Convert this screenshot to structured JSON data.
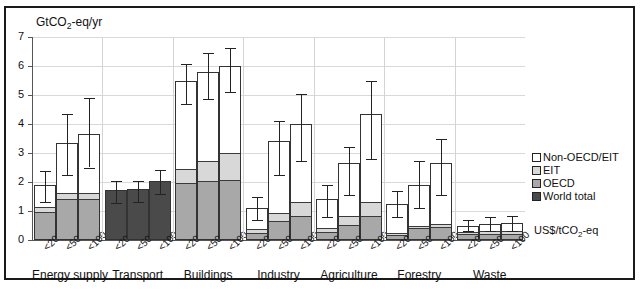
{
  "chart_data": {
    "type": "bar",
    "title": "GtCO2-eq/yr",
    "title_html": "GtCO<sub>2</sub>-eq/yr",
    "ylabel": "GtCO2-eq/yr",
    "xlabel": "US$/tCO2-eq",
    "xlabel_html": "US$/tCO<sub>2</sub>-eq",
    "ylim": [
      0,
      7
    ],
    "yticks": [
      0,
      1,
      2,
      3,
      4,
      5,
      6,
      7
    ],
    "ytick_labels": [
      "0",
      "1",
      "2",
      "3",
      "4",
      "5",
      "6",
      "7"
    ],
    "grid": true,
    "legend_position": "right",
    "stacked": true,
    "categories": [
      "Energy supply",
      "Transport",
      "Buildings",
      "Industry",
      "Agriculture",
      "Forestry",
      "Waste"
    ],
    "subcategories": [
      "<20",
      "<50",
      "<100"
    ],
    "series": [
      {
        "name": "OECD",
        "color": "#a8a8a8"
      },
      {
        "name": "EIT",
        "color": "#d8d8d8"
      },
      {
        "name": "Non-OECD/EIT",
        "color": "#ffffff"
      },
      {
        "name": "World total",
        "color": "#4a4a4a"
      }
    ],
    "groups": [
      {
        "label": "Energy supply",
        "world_total_only": false,
        "bars": [
          {
            "sub": "<20",
            "oecd": 0.92,
            "eit": 0.18,
            "non_oecd": 0.8,
            "total": 1.9,
            "err_low": 1.32,
            "err_high": 2.38
          },
          {
            "sub": "<50",
            "oecd": 1.38,
            "eit": 0.2,
            "non_oecd": 1.77,
            "total": 3.35,
            "err_low": 2.25,
            "err_high": 4.35
          },
          {
            "sub": "<100",
            "oecd": 1.38,
            "eit": 0.22,
            "non_oecd": 2.07,
            "total": 3.67,
            "err_low": 2.5,
            "err_high": 4.9
          }
        ]
      },
      {
        "label": "Transport",
        "world_total_only": true,
        "bars": [
          {
            "sub": "<20",
            "world": 1.72,
            "total": 1.72,
            "err_low": 1.28,
            "err_high": 2.03
          },
          {
            "sub": "<50",
            "world": 1.76,
            "total": 1.76,
            "err_low": 1.32,
            "err_high": 2.05
          },
          {
            "sub": "<100",
            "world": 2.03,
            "total": 2.03,
            "err_low": 1.6,
            "err_high": 2.42
          }
        ]
      },
      {
        "label": "Buildings",
        "world_total_only": false,
        "bars": [
          {
            "sub": "<20",
            "oecd": 1.92,
            "eit": 0.48,
            "non_oecd": 3.1,
            "total": 5.5,
            "err_low": 4.68,
            "err_high": 6.07
          },
          {
            "sub": "<50",
            "oecd": 2.0,
            "eit": 0.7,
            "non_oecd": 3.08,
            "total": 5.78,
            "err_low": 4.85,
            "err_high": 6.45
          },
          {
            "sub": "<100",
            "oecd": 2.03,
            "eit": 0.93,
            "non_oecd": 3.04,
            "total": 6.0,
            "err_low": 5.1,
            "err_high": 6.62
          }
        ]
      },
      {
        "label": "Industry",
        "world_total_only": false,
        "bars": [
          {
            "sub": "<20",
            "oecd": 0.22,
            "eit": 0.12,
            "non_oecd": 0.76,
            "total": 1.1,
            "err_low": 0.68,
            "err_high": 1.5
          },
          {
            "sub": "<50",
            "oecd": 0.62,
            "eit": 0.27,
            "non_oecd": 2.53,
            "total": 3.42,
            "err_low": 2.25,
            "err_high": 4.1
          },
          {
            "sub": "<100",
            "oecd": 0.8,
            "eit": 0.47,
            "non_oecd": 2.73,
            "total": 4.0,
            "err_low": 2.72,
            "err_high": 5.03
          }
        ]
      },
      {
        "label": "Agriculture",
        "world_total_only": false,
        "bars": [
          {
            "sub": "<20",
            "oecd": 0.23,
            "eit": 0.15,
            "non_oecd": 1.02,
            "total": 1.4,
            "err_low": 0.78,
            "err_high": 1.88
          },
          {
            "sub": "<50",
            "oecd": 0.48,
            "eit": 0.32,
            "non_oecd": 1.85,
            "total": 2.65,
            "err_low": 1.55,
            "err_high": 3.22
          },
          {
            "sub": "<100",
            "oecd": 0.8,
            "eit": 0.48,
            "non_oecd": 3.05,
            "total": 4.33,
            "err_low": 2.8,
            "err_high": 5.48
          }
        ]
      },
      {
        "label": "Forestry",
        "world_total_only": false,
        "bars": [
          {
            "sub": "<20",
            "oecd": 0.15,
            "eit": 0.07,
            "non_oecd": 1.03,
            "total": 1.25,
            "err_low": 0.78,
            "err_high": 1.7
          },
          {
            "sub": "<50",
            "oecd": 0.37,
            "eit": 0.08,
            "non_oecd": 1.45,
            "total": 1.9,
            "err_low": 1.12,
            "err_high": 2.72
          },
          {
            "sub": "<100",
            "oecd": 0.42,
            "eit": 0.1,
            "non_oecd": 2.15,
            "total": 2.67,
            "err_low": 1.55,
            "err_high": 3.5
          }
        ]
      },
      {
        "label": "Waste",
        "world_total_only": false,
        "bars": [
          {
            "sub": "<20",
            "oecd": 0.17,
            "eit": 0.08,
            "non_oecd": 0.22,
            "total": 0.47,
            "err_low": 0.3,
            "err_high": 0.68
          },
          {
            "sub": "<50",
            "oecd": 0.18,
            "eit": 0.08,
            "non_oecd": 0.29,
            "total": 0.55,
            "err_low": 0.3,
            "err_high": 0.8
          },
          {
            "sub": "<100",
            "oecd": 0.18,
            "eit": 0.08,
            "non_oecd": 0.32,
            "total": 0.58,
            "err_low": 0.3,
            "err_high": 0.83
          }
        ]
      }
    ],
    "legend": [
      {
        "label": "Non-OECD/EIT",
        "color": "#ffffff"
      },
      {
        "label": "EIT",
        "color": "#d8d8d8"
      },
      {
        "label": "OECD",
        "color": "#a8a8a8"
      },
      {
        "label": "World total",
        "color": "#4a4a4a"
      }
    ]
  }
}
